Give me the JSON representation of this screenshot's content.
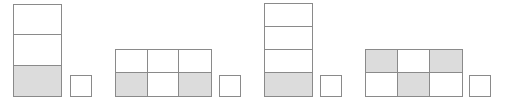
{
  "figures": [
    {
      "id": "fig-1",
      "rows": 3,
      "cols": 1,
      "shaded": [
        [
          0
        ],
        [
          0
        ],
        [
          1
        ]
      ],
      "unit_square": true
    },
    {
      "id": "fig-2",
      "rows": 2,
      "cols": 3,
      "shaded": [
        [
          0,
          0,
          0
        ],
        [
          1,
          0,
          1
        ]
      ],
      "unit_square": true
    },
    {
      "id": "fig-3",
      "rows": 4,
      "cols": 1,
      "shaded": [
        [
          0
        ],
        [
          0
        ],
        [
          0
        ],
        [
          1
        ]
      ],
      "unit_square": true
    },
    {
      "id": "fig-4",
      "rows": 2,
      "cols": 3,
      "shaded": [
        [
          1,
          0,
          1
        ],
        [
          0,
          1,
          0
        ]
      ],
      "unit_square": true
    }
  ],
  "colors": {
    "stroke": "#8a8a8a",
    "shade": "#dcdcdc",
    "background": "#ffffff"
  }
}
